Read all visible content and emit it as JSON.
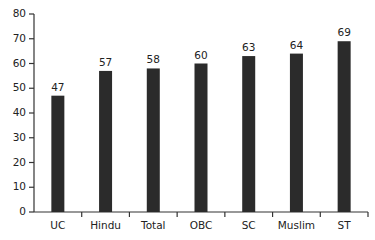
{
  "chart_data": {
    "type": "bar",
    "title": "",
    "xlabel": "",
    "ylabel": "",
    "categories": [
      "UC",
      "Hindu",
      "Total",
      "OBC",
      "SC",
      "Muslim",
      "ST"
    ],
    "values": [
      47,
      57,
      58,
      60,
      63,
      64,
      69
    ],
    "data_labels": [
      "47",
      "57",
      "58",
      "60",
      "63",
      "64",
      "69"
    ],
    "ylim": [
      0,
      80
    ],
    "yticks": [
      0,
      10,
      20,
      30,
      40,
      50,
      60,
      70,
      80
    ],
    "grid": false,
    "legend": null,
    "bar_color": "#2b2b2b"
  }
}
